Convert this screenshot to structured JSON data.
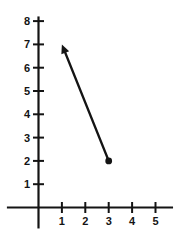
{
  "figure": {
    "background": "#ffffff",
    "ink": "#141414"
  },
  "chart_data": {
    "type": "line",
    "title": "",
    "xlabel": "",
    "ylabel": "",
    "grid": false,
    "x_tick_labels": [
      "1",
      "2",
      "3",
      "4",
      "5"
    ],
    "y_tick_labels": [
      "1",
      "2",
      "3",
      "4",
      "5",
      "6",
      "7",
      "8"
    ],
    "xlim": [
      -1.35,
      5.75
    ],
    "ylim": [
      -0.9,
      8.2
    ],
    "series": [
      {
        "name": "vector",
        "points": [
          [
            3,
            2
          ],
          [
            1,
            7
          ]
        ],
        "start_marker": "filled-dot",
        "end_marker": "arrowhead",
        "color": "#141414"
      }
    ]
  }
}
